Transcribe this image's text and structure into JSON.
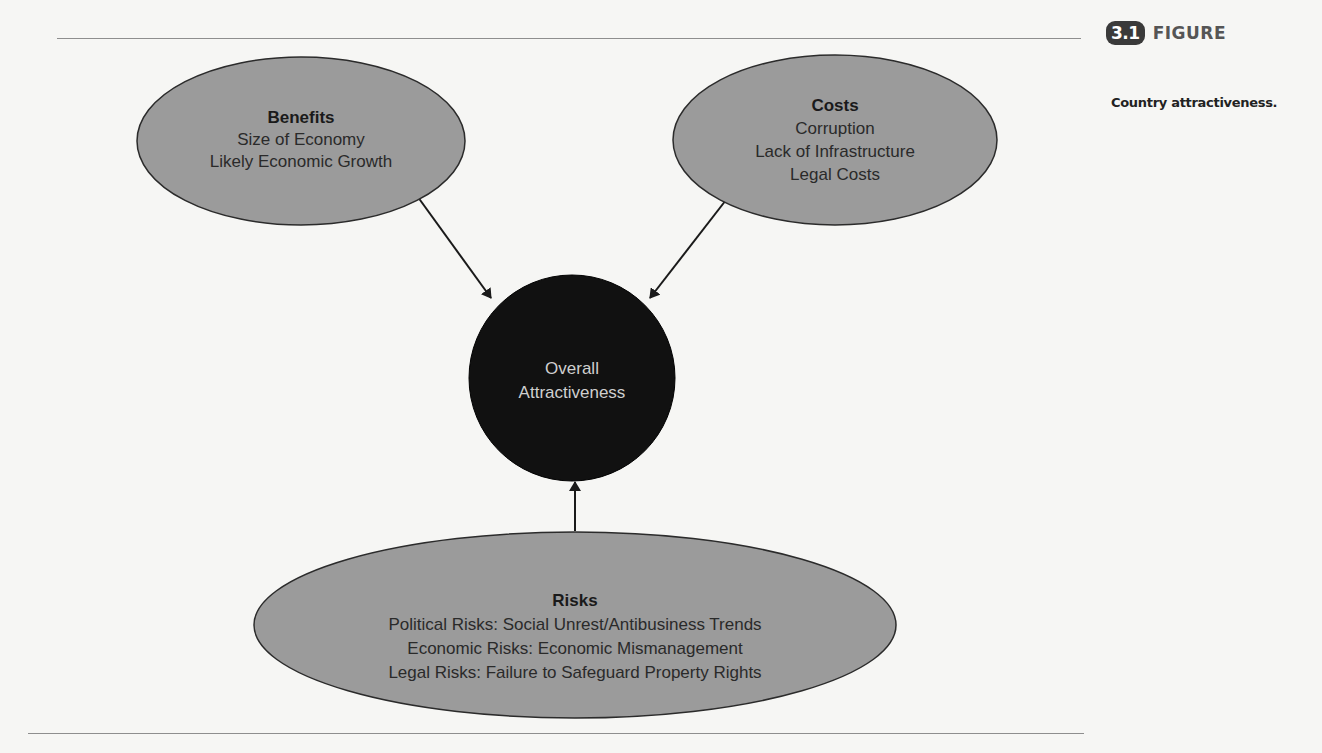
{
  "figure": {
    "number": "3.1",
    "label": "FIGURE",
    "caption": "Country attractiveness."
  },
  "diagram": {
    "center": {
      "lines": [
        "Overall",
        "Attractiveness"
      ],
      "fill": "#111111",
      "text_color": "#cfcfcf"
    },
    "benefits": {
      "title": "Benefits",
      "items": [
        "Size of Economy",
        "Likely Economic Growth"
      ]
    },
    "costs": {
      "title": "Costs",
      "items": [
        "Corruption",
        "Lack of Infrastructure",
        "Legal Costs"
      ]
    },
    "risks": {
      "title": "Risks",
      "items": [
        "Political Risks: Social Unrest/Antibusiness Trends",
        "Economic Risks: Economic Mismanagement",
        "Legal Risks: Failure to Safeguard Property Rights"
      ]
    },
    "colors": {
      "node_fill": "#9b9b9b",
      "node_stroke": "#2b2b2b",
      "arrow": "#1a1a1a"
    },
    "edges": [
      {
        "from": "benefits",
        "to": "center"
      },
      {
        "from": "costs",
        "to": "center"
      },
      {
        "from": "risks",
        "to": "center"
      }
    ]
  }
}
